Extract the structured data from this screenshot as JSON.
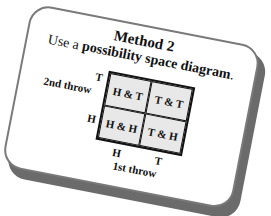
{
  "card": {
    "title": "Method 2",
    "subtitle_prefix": "Use a ",
    "subtitle_bold": "possibility space diagram",
    "subtitle_suffix": "."
  },
  "diagram": {
    "y_axis_label": "2nd throw",
    "x_axis_label": "1st throw",
    "y_ticks": [
      "T",
      "H"
    ],
    "x_ticks": [
      "H",
      "T"
    ],
    "cells": [
      [
        "H & T",
        "T & T"
      ],
      [
        "H & H",
        "T & H"
      ]
    ]
  },
  "colors": {
    "cell_fill": "#e8e8e8",
    "card_border": "#7a7a7a",
    "shadow": "#6b6b6b"
  }
}
